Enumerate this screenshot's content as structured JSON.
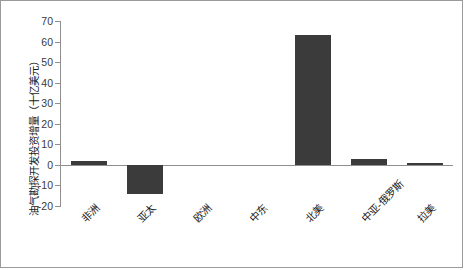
{
  "chart_data": {
    "type": "bar",
    "title": "",
    "xlabel": "",
    "ylabel": "油气勘探开发投资增量（十亿美元）",
    "ylim": [
      -20,
      70
    ],
    "yticks": [
      70,
      60,
      50,
      40,
      30,
      20,
      10,
      0,
      -10,
      -20
    ],
    "ytick_labels": [
      "70",
      "60",
      "50",
      "40",
      "30",
      "20",
      "10",
      "0",
      "-10",
      "-20"
    ],
    "grid": false,
    "legend": "none",
    "bar_color": "#3b3b3b",
    "axis_color": "#8f8f8f",
    "categories": [
      "非洲",
      "亚太",
      "欧洲",
      "中东",
      "北美",
      "中亚-俄罗斯",
      "拉美"
    ],
    "values": [
      2,
      -14,
      0,
      0,
      63,
      3,
      1
    ],
    "series": [
      {
        "name": "油气勘探开发投资增量",
        "values": [
          2,
          -14,
          0,
          0,
          63,
          3,
          1
        ]
      }
    ],
    "points": [
      {
        "category": "非洲",
        "value": 2
      },
      {
        "category": "亚太",
        "value": -14
      },
      {
        "category": "欧洲",
        "value": 0
      },
      {
        "category": "中东",
        "value": 0
      },
      {
        "category": "北美",
        "value": 63
      },
      {
        "category": "中亚-俄罗斯",
        "value": 3
      },
      {
        "category": "拉美",
        "value": 1
      }
    ]
  }
}
